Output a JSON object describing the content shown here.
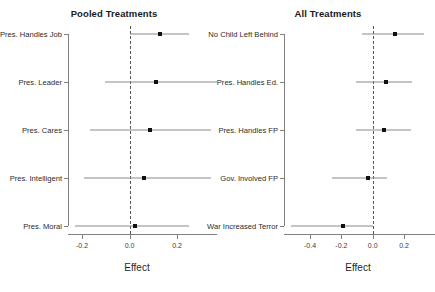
{
  "figure": {
    "width": 435,
    "height": 292,
    "background": "#ffffff",
    "point_color": "#111111",
    "interval_color": "#8a8a8a",
    "axis_color": "#808080",
    "zero_line_color": "#555555",
    "zero_line_style": "dashed"
  },
  "chart_data": [
    {
      "type": "scatter",
      "subtype": "coefficient-plot",
      "panel_id": "pooled",
      "title": "Pooled Treatments",
      "xlabel": "Effect",
      "ylabel": "",
      "grid": false,
      "legend": "none",
      "zero_reference_line": 0.0,
      "xlim": [
        -0.28,
        0.33
      ],
      "xticks": [
        -0.2,
        0.0,
        0.2
      ],
      "xtick_labels": [
        "-0.2",
        "0.0",
        "0.2"
      ],
      "categories": [
        "Pres. Handles Job",
        "Pres. Leader",
        "Pres. Cares",
        "Pres. Intelligent",
        "Pres. Moral"
      ],
      "values": [
        0.13,
        0.11,
        0.088,
        0.062,
        0.025
      ],
      "ci_low": [
        0.0,
        -0.105,
        -0.168,
        -0.193,
        -0.228
      ],
      "ci_high": [
        0.252,
        0.368,
        0.342,
        0.342,
        0.252
      ],
      "points": [
        {
          "label": "Pres. Handles Job",
          "estimate": 0.13,
          "ci_low": 0.0,
          "ci_high": 0.252
        },
        {
          "label": "Pres. Leader",
          "estimate": 0.11,
          "ci_low": -0.105,
          "ci_high": 0.368
        },
        {
          "label": "Pres. Cares",
          "estimate": 0.088,
          "ci_low": -0.168,
          "ci_high": 0.342
        },
        {
          "label": "Pres. Intelligent",
          "estimate": 0.062,
          "ci_low": -0.193,
          "ci_high": 0.342
        },
        {
          "label": "Pres. Moral",
          "estimate": 0.025,
          "ci_low": -0.228,
          "ci_high": 0.252
        }
      ]
    },
    {
      "type": "scatter",
      "subtype": "coefficient-plot",
      "panel_id": "all",
      "title": "All Treatments",
      "xlabel": "Effect",
      "ylabel": "",
      "grid": false,
      "legend": "none",
      "zero_reference_line": 0.0,
      "xlim": [
        -0.52,
        0.35
      ],
      "xticks": [
        -0.4,
        -0.2,
        0.0,
        0.2
      ],
      "xtick_labels": [
        "-0.4",
        "-0.2",
        "0.0",
        "0.2"
      ],
      "categories": [
        "No Child Left Behind",
        "Pres. Handles Ed.",
        "Pres. Handles FP",
        "Gov. Involved FP",
        "War Increased Terror"
      ],
      "values": [
        0.14,
        0.082,
        0.073,
        -0.032,
        -0.19
      ],
      "ci_low": [
        -0.07,
        -0.105,
        -0.105,
        -0.26,
        -0.52
      ],
      "ci_high": [
        0.33,
        0.25,
        0.245,
        0.09,
        0.0
      ],
      "points": [
        {
          "label": "No Child Left Behind",
          "estimate": 0.14,
          "ci_low": -0.07,
          "ci_high": 0.33
        },
        {
          "label": "Pres. Handles Ed.",
          "estimate": 0.082,
          "ci_low": -0.105,
          "ci_high": 0.25
        },
        {
          "label": "Pres. Handles FP",
          "estimate": 0.073,
          "ci_low": -0.105,
          "ci_high": 0.245
        },
        {
          "label": "Gov. Involved FP",
          "estimate": -0.032,
          "ci_low": -0.26,
          "ci_high": 0.09
        },
        {
          "label": "War Increased Terror",
          "estimate": -0.19,
          "ci_low": -0.52,
          "ci_high": 0.0
        }
      ]
    }
  ]
}
